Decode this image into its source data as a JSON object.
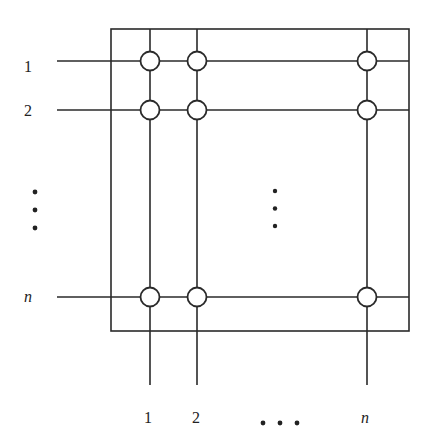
{
  "diagram": {
    "type": "crossbar-switch",
    "stroke_color": "#2a2a2a",
    "background": "#ffffff",
    "row_labels": [
      "1",
      "2",
      "n"
    ],
    "column_labels": [
      "1",
      "2",
      "n"
    ],
    "row_ellipsis": "vertical-dots",
    "column_ellipsis": "horizontal-dots",
    "crosspoints": [
      {
        "row": "1",
        "col": "1"
      },
      {
        "row": "1",
        "col": "2"
      },
      {
        "row": "1",
        "col": "n"
      },
      {
        "row": "2",
        "col": "1"
      },
      {
        "row": "2",
        "col": "2"
      },
      {
        "row": "2",
        "col": "n"
      },
      {
        "row": "n",
        "col": "1"
      },
      {
        "row": "n",
        "col": "2"
      },
      {
        "row": "n",
        "col": "n"
      }
    ]
  }
}
